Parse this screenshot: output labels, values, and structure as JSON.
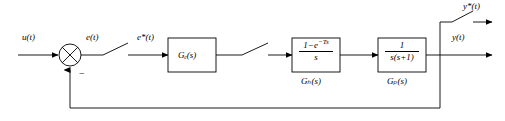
{
  "diagram": {
    "type": "block-diagram",
    "line_color": "#000000",
    "background_color": "#ffffff"
  },
  "signals": {
    "input": "u(t)",
    "error": "e(t)",
    "sampled_error": "e*(t)",
    "output": "y(t)",
    "sampled_output": "y*(t)",
    "feedback_sign": "−"
  },
  "blocks": [
    {
      "id": "controller",
      "inner_label": "Gₑ(s)",
      "inner_text": "Gc(s)",
      "under_label": ""
    },
    {
      "id": "hold",
      "numerator": "1−e",
      "numerator_exponent": "−Ts",
      "denominator": "s",
      "under_label": "Gₕ(s)"
    },
    {
      "id": "plant",
      "numerator": "1",
      "denominator": "s(s+1)",
      "under_label": "Gₚ(s)"
    }
  ],
  "junctions": {
    "summing": {
      "name": "summing-junction",
      "shape": "circle-with-cross",
      "negative_input": "−"
    }
  },
  "samplers": [
    {
      "id": "sampler-1",
      "label": "e*(t)"
    },
    {
      "id": "sampler-2",
      "label": ""
    },
    {
      "id": "sampler-3",
      "label": "y*(t)"
    }
  ]
}
